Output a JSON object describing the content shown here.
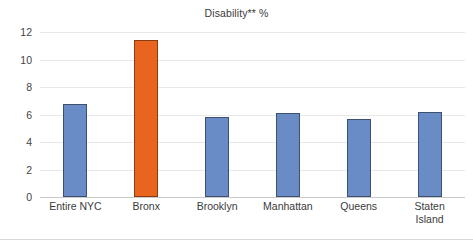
{
  "chart_data": {
    "type": "bar",
    "title": "Disability** %",
    "xlabel": "",
    "ylabel": "",
    "categories": [
      "Entire NYC",
      "Bronx",
      "Brooklyn",
      "Manhattan",
      "Queens",
      "Staten Island"
    ],
    "category_lines": [
      [
        "Entire NYC"
      ],
      [
        "Bronx"
      ],
      [
        "Brooklyn"
      ],
      [
        "Manhattan"
      ],
      [
        "Queens"
      ],
      [
        "Staten",
        "Island"
      ]
    ],
    "values": [
      6.8,
      11.4,
      5.8,
      6.1,
      5.7,
      6.2
    ],
    "ylim": [
      0,
      12
    ],
    "yticks": [
      0,
      2,
      4,
      6,
      8,
      10,
      12
    ],
    "ytick_labels": [
      "0",
      "2",
      "4",
      "6",
      "8",
      "10",
      "12"
    ],
    "grid": true,
    "legend": false,
    "highlight_index": 1,
    "bar_colors": [
      "#6a8cc6",
      "#e8641f",
      "#6a8cc6",
      "#6a8cc6",
      "#6a8cc6",
      "#6a8cc6"
    ],
    "colors": {
      "series_default": "#6a8cc6",
      "series_highlight": "#e8641f",
      "bar_outline_default": "#3d506e",
      "bar_outline_highlight": "#8a3b12",
      "gridline": "#e8e8e8",
      "axis": "#c9c9c9",
      "text": "#3b3b3b",
      "background": "#ffffff"
    }
  }
}
